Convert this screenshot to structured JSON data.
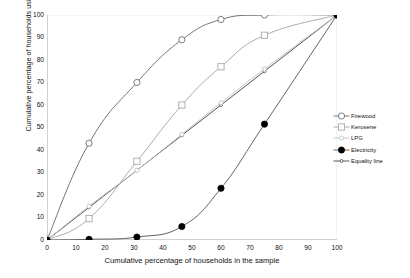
{
  "chart_data": {
    "type": "line",
    "title": "",
    "xlabel": "Cumulative percentage of households in the sample",
    "ylabel": "Cumulative percentage of households using various energy carriers",
    "xlim": [
      0,
      100
    ],
    "ylim": [
      0,
      100
    ],
    "xticks": [
      0,
      10,
      20,
      30,
      40,
      50,
      60,
      70,
      80,
      90,
      100
    ],
    "yticks": [
      0,
      10,
      20,
      30,
      40,
      50,
      60,
      70,
      80,
      90,
      100
    ],
    "grid": false,
    "legend_position": "right",
    "x": [
      0,
      14.5,
      31,
      46.5,
      60,
      75,
      100
    ],
    "series": [
      {
        "name": "Firewood",
        "marker": "open-circle",
        "color": "#6e6e6e",
        "values": [
          0,
          43,
          70,
          89,
          98,
          100,
          100
        ]
      },
      {
        "name": "Kerosene",
        "marker": "open-square",
        "color": "#a8a8a8",
        "values": [
          0,
          9.5,
          35,
          60,
          77,
          91,
          100
        ]
      },
      {
        "name": "LPG",
        "marker": "open-circle-small",
        "color": "#c2c2c2",
        "values": [
          0,
          15,
          31,
          47,
          61,
          76,
          100
        ]
      },
      {
        "name": "Electricity",
        "marker": "filled-circle",
        "color": "#5a5a5a",
        "values": [
          0,
          0.3,
          1.3,
          6,
          23,
          51.5,
          100
        ]
      },
      {
        "name": "Equality line",
        "marker": "open-circle-tiny",
        "color": "#4a4a4a",
        "values": [
          0,
          14.5,
          31,
          46.5,
          60,
          75,
          100
        ]
      }
    ]
  },
  "legend": {
    "items": [
      {
        "label": "Firewood"
      },
      {
        "label": "Kerosene"
      },
      {
        "label": "LPG"
      },
      {
        "label": "Electricity"
      },
      {
        "label": "Equality line"
      }
    ]
  }
}
